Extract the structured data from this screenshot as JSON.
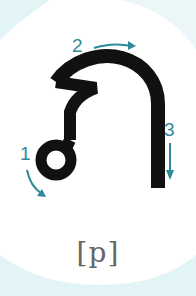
{
  "diagram": {
    "type": "stroke-order",
    "character": "ป",
    "label": "[p]",
    "strokes": [
      {
        "number": "1",
        "direction": "curve-down-right"
      },
      {
        "number": "2",
        "direction": "right"
      },
      {
        "number": "3",
        "direction": "down"
      }
    ],
    "colors": {
      "background": "#ffffff",
      "corner_tint": "#e3f4f6",
      "stroke": "#111111",
      "arrow": "#2e8a9a",
      "label": "#666666"
    }
  }
}
